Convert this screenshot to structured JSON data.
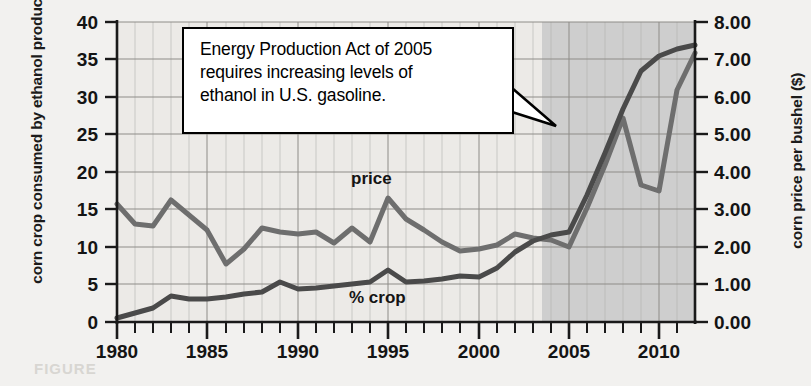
{
  "figure": {
    "bleed_text": "FIGURE"
  },
  "chart_data": {
    "type": "line",
    "title": "",
    "xlabel": "",
    "ylabel": "corn crop consumed by ethanol production (%)",
    "y2label": "corn price per bushel ($)",
    "xlim": [
      1980,
      2012
    ],
    "ylim": [
      0,
      40
    ],
    "y2lim": [
      0,
      8
    ],
    "grid": true,
    "legend": "inline-labels",
    "x_ticks_major": [
      1980,
      1985,
      1990,
      1995,
      2000,
      2005,
      2010
    ],
    "x_ticks_minor_step": 1,
    "y_ticks_left": [
      0,
      5,
      10,
      15,
      20,
      25,
      30,
      35,
      40
    ],
    "y_ticks_right": [
      "0.00",
      "1.00",
      "2.00",
      "3.00",
      "4.00",
      "5.00",
      "6.00",
      "7.00",
      "8.00"
    ],
    "shaded_region": {
      "from": 2005,
      "to": 2012,
      "color": "#c9c9c9",
      "label": ""
    },
    "x": [
      1980,
      1981,
      1982,
      1983,
      1984,
      1985,
      1986,
      1987,
      1988,
      1989,
      1990,
      1991,
      1992,
      1993,
      1994,
      1995,
      1996,
      1997,
      1998,
      1999,
      2000,
      2001,
      2002,
      2003,
      2004,
      2005,
      2006,
      2007,
      2008,
      2009,
      2010,
      2011,
      2012
    ],
    "series": [
      {
        "name": "price",
        "axis": "right",
        "units": "$ per bushel",
        "label_text": "price",
        "color": "#6e6e6e",
        "values": [
          3.15,
          2.6,
          2.55,
          3.25,
          2.85,
          2.45,
          1.55,
          1.95,
          2.5,
          2.4,
          2.35,
          2.4,
          2.1,
          2.5,
          2.15,
          3.3,
          2.75,
          2.45,
          2.15,
          1.9,
          1.95,
          2.05,
          2.35,
          2.25,
          2.2,
          2.0,
          3.05,
          4.2,
          5.45,
          3.65,
          3.5,
          6.2,
          7.2
        ]
      },
      {
        "name": "% crop",
        "axis": "left",
        "units": "%",
        "label_text": "% crop",
        "color": "#4a4a4a",
        "values": [
          0.6,
          1.2,
          1.9,
          3.4,
          3.0,
          3.0,
          3.3,
          3.7,
          4.0,
          5.3,
          4.4,
          4.5,
          4.8,
          5.1,
          5.4,
          7.0,
          5.4,
          5.5,
          5.8,
          6.2,
          6.0,
          7.2,
          9.4,
          10.9,
          11.6,
          12.0,
          17.0,
          22.5,
          28.5,
          33.5,
          35.5,
          36.5,
          37.0
        ]
      }
    ],
    "annotation": {
      "text": "Energy Production Act of 2005 requires increasing levels of ethanol in U.S. gasoline.",
      "lines": [
        "Energy Production Act of 2005",
        "requires increasing levels of",
        "ethanol in U.S. gasoline."
      ],
      "points_to_year": 2005
    },
    "colors": {
      "background": "#f2f1ef",
      "plot_background": "#eceae7",
      "grid": "#9a9a9a",
      "axis": "#1a1a1a",
      "shade": "#c9c9c9",
      "price_line": "#6e6e6e",
      "crop_line": "#4a4a4a",
      "callout_bg": "#ffffff",
      "callout_border": "#000000"
    }
  }
}
